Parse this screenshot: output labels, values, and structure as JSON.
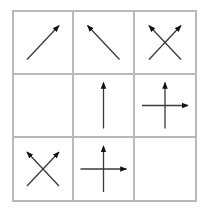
{
  "diagram": {
    "type": "arrow-matrix-puzzle",
    "rows": 3,
    "cols": 3,
    "grid_color": "#b9b9b9",
    "arrow_color": "#3a3a3a",
    "arrowhead_color": "#111111",
    "cells": [
      {
        "row": 0,
        "col": 0,
        "arrows": [
          "up-right"
        ]
      },
      {
        "row": 0,
        "col": 1,
        "arrows": [
          "up-left"
        ]
      },
      {
        "row": 0,
        "col": 2,
        "arrows": [
          "up-right",
          "up-left"
        ]
      },
      {
        "row": 1,
        "col": 0,
        "arrows": []
      },
      {
        "row": 1,
        "col": 1,
        "arrows": [
          "up"
        ]
      },
      {
        "row": 1,
        "col": 2,
        "arrows": [
          "up",
          "right"
        ]
      },
      {
        "row": 2,
        "col": 0,
        "arrows": [
          "up-right",
          "up-left"
        ]
      },
      {
        "row": 2,
        "col": 1,
        "arrows": [
          "up",
          "right"
        ]
      },
      {
        "row": 2,
        "col": 2,
        "arrows": []
      }
    ]
  }
}
